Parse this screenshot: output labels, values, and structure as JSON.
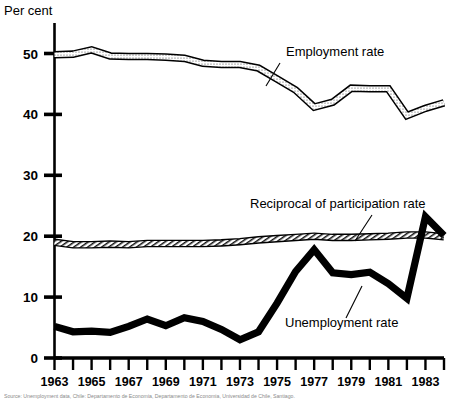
{
  "chart_data": {
    "type": "line",
    "title": "",
    "ylabel": "Per cent",
    "xlabel": "",
    "ylim": [
      0,
      55
    ],
    "yticks": [
      0,
      10,
      20,
      30,
      40,
      50
    ],
    "ytick_labels": [
      "0",
      "10",
      "20",
      "30",
      "40",
      "50"
    ],
    "grid": false,
    "legend_position": "inline-annotations",
    "xlim": [
      1963,
      1984
    ],
    "x": [
      1963,
      1964,
      1965,
      1966,
      1967,
      1968,
      1969,
      1970,
      1971,
      1972,
      1973,
      1974,
      1975,
      1976,
      1977,
      1978,
      1979,
      1980,
      1981,
      1982,
      1983,
      1984
    ],
    "xtick_labels": [
      "1963",
      "1964",
      "1965",
      "1966",
      "1967",
      "1968",
      "1969",
      "1970",
      "1971",
      "1972",
      "1973",
      "1974",
      "1975",
      "1976",
      "1977",
      "1978",
      "1979",
      "1980",
      "1981",
      "1982",
      "1983",
      "1984"
    ],
    "xtick_labels_shown": [
      "1963",
      "1965",
      "1967",
      "1969",
      "1971",
      "1973",
      "1975",
      "1977",
      "1979",
      "1981",
      "1983"
    ],
    "series": [
      {
        "name": "Employment rate",
        "style": "thick-outlined-stippled",
        "values": [
          49.8,
          49.9,
          50.6,
          49.6,
          49.5,
          49.5,
          49.4,
          49.2,
          48.4,
          48.2,
          48.2,
          47.6,
          45.8,
          44.0,
          41.2,
          42.0,
          44.3,
          44.2,
          44.2,
          39.8,
          41.0,
          41.9
        ]
      },
      {
        "name": "Reciprocal of participation rate",
        "style": "thick-outlined-hatched",
        "values": [
          19.0,
          18.6,
          18.6,
          18.7,
          18.6,
          18.8,
          18.8,
          18.8,
          18.8,
          18.9,
          19.1,
          19.4,
          19.6,
          19.8,
          20.0,
          19.8,
          19.8,
          19.9,
          20.0,
          20.2,
          20.2,
          19.9
        ]
      },
      {
        "name": "Unemployment rate",
        "style": "thick-solid-black",
        "values": [
          5.2,
          4.3,
          4.4,
          4.2,
          5.2,
          6.4,
          5.3,
          6.6,
          6.0,
          4.7,
          3.0,
          4.3,
          9.0,
          14.2,
          17.8,
          14.0,
          13.7,
          14.1,
          12.2,
          9.8,
          23.2,
          20.1
        ]
      }
    ],
    "annotations": [
      {
        "text": "Employment rate",
        "x_px": 286,
        "y_px": 56
      },
      {
        "text": "Reciprocal of participation rate",
        "x_px": 250,
        "y_px": 208
      },
      {
        "text": "Unemployment rate",
        "x_px": 285,
        "y_px": 327
      }
    ]
  },
  "axis": {
    "y_title": "Per cent"
  },
  "footnote": {
    "text": "Source: Unemployment data, Chile: Departamento de Economia, Departamento de Economia, Universidad de Chile, Santiago."
  }
}
